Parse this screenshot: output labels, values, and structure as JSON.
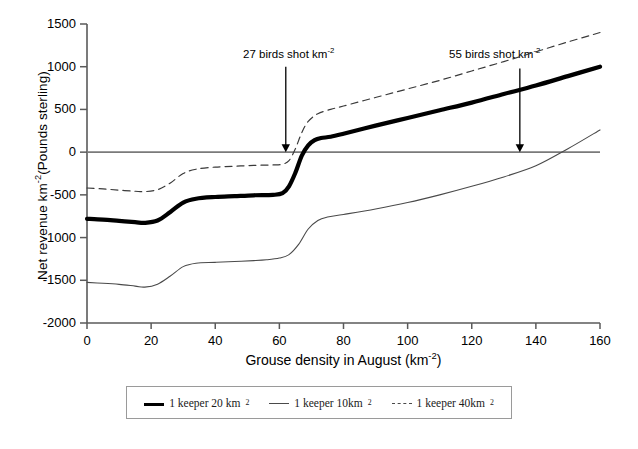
{
  "chart_data": {
    "type": "line",
    "title": "",
    "xlabel": "Grouse density in August (km-2)",
    "xlabel_base": "Grouse density in August (km",
    "xlabel_sup": "-2",
    "xlabel_tail": ")",
    "ylabel": "Net revenue km-2(Pounds sterling)",
    "ylabel_base": "Net revenue km",
    "ylabel_sup": "-2",
    "ylabel_tail": "(Pounds sterling)",
    "xlim": [
      0,
      160
    ],
    "ylim": [
      -2000,
      1500
    ],
    "xticks": [
      0,
      20,
      40,
      60,
      80,
      100,
      120,
      140,
      160
    ],
    "yticks": [
      1500,
      1000,
      500,
      0,
      -500,
      -1000,
      -1500,
      -2000
    ],
    "grid": false,
    "zero_line": 0,
    "legend_position": "below-axes",
    "series": [
      {
        "name": "1 keeper 20 km2",
        "label_base": "1 keeper 20 km",
        "label_sup": "2",
        "style": "thick-solid",
        "color": "#000000",
        "x": [
          0,
          5,
          10,
          15,
          18,
          22,
          26,
          30,
          34,
          40,
          46,
          52,
          58,
          61,
          63,
          65,
          67,
          69,
          71,
          73,
          76,
          80,
          90,
          100,
          110,
          120,
          130,
          140,
          150,
          160
        ],
        "y": [
          -780,
          -790,
          -805,
          -820,
          -828,
          -800,
          -700,
          -590,
          -545,
          -525,
          -515,
          -505,
          -500,
          -480,
          -400,
          -240,
          -40,
          80,
          140,
          165,
          180,
          215,
          310,
          400,
          490,
          580,
          680,
          780,
          890,
          1000
        ]
      },
      {
        "name": "1 keeper 10km2",
        "label_base": "1 keeper 10km",
        "label_sup": "2",
        "style": "thin-solid",
        "color": "#4a4a4a",
        "x": [
          0,
          5,
          10,
          15,
          18,
          22,
          26,
          30,
          34,
          40,
          46,
          52,
          56,
          60,
          63,
          66,
          69,
          72,
          75,
          80,
          90,
          100,
          110,
          120,
          130,
          140,
          150,
          160
        ],
        "y": [
          -1525,
          -1535,
          -1548,
          -1568,
          -1580,
          -1545,
          -1450,
          -1340,
          -1300,
          -1290,
          -1280,
          -1270,
          -1260,
          -1240,
          -1200,
          -1080,
          -900,
          -800,
          -760,
          -730,
          -665,
          -590,
          -500,
          -400,
          -290,
          -160,
          40,
          260
        ]
      },
      {
        "name": "1 keeper 40km2",
        "label_base": "1 keeper 40km",
        "label_sup": "2",
        "style": "thin-dashed",
        "color": "#3a3a3a",
        "x": [
          0,
          5,
          10,
          15,
          18,
          22,
          26,
          30,
          34,
          40,
          46,
          52,
          58,
          61,
          63,
          65,
          67,
          69,
          72,
          76,
          80,
          90,
          100,
          110,
          120,
          130,
          140,
          150,
          160
        ],
        "y": [
          -420,
          -430,
          -445,
          -458,
          -462,
          -440,
          -360,
          -250,
          -200,
          -175,
          -165,
          -155,
          -150,
          -140,
          -100,
          40,
          230,
          360,
          450,
          500,
          540,
          640,
          740,
          840,
          950,
          1060,
          1175,
          1290,
          1400
        ]
      }
    ],
    "annotations": [
      {
        "text": "27 birds shot km-2",
        "text_base": "27 birds shot km",
        "text_sup": "-2",
        "label_x_px": 243,
        "label_y_px": 48,
        "arrow_x_data": 62,
        "arrow_y_top_data": 1000,
        "arrow_y_bottom_data": 0
      },
      {
        "text": "55 birds shot km-2",
        "text_base": "55 birds shot km",
        "text_sup": "-2",
        "label_x_px": 449,
        "label_y_px": 48,
        "arrow_x_data": 135,
        "arrow_y_top_data": 980,
        "arrow_y_bottom_data": 0
      }
    ]
  },
  "colors": {
    "axis": "#5a5a5a",
    "zero_line": "#7a7a7a",
    "thick_series": "#000000",
    "thin_series": "#4a4a4a",
    "dashed_series": "#3a3a3a",
    "legend_border": "#9a9a9a",
    "background": "#ffffff"
  }
}
